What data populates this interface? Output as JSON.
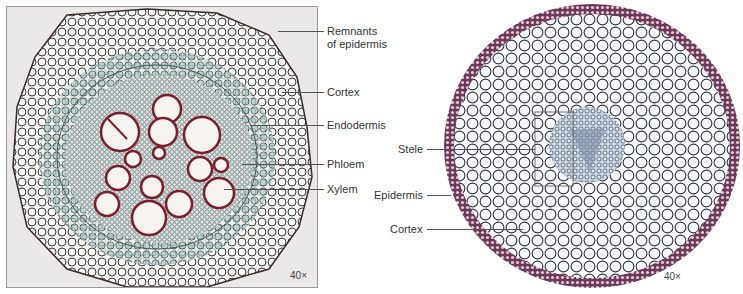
{
  "figures": [
    {
      "id": "left",
      "magnification": "40×",
      "labels": [
        {
          "text": "Remnants",
          "text2": "of epidermis"
        },
        {
          "text": "Cortex"
        },
        {
          "text": "Endodermis"
        },
        {
          "text": "Phloem"
        },
        {
          "text": "Xylem"
        }
      ]
    },
    {
      "id": "right",
      "magnification": "40×",
      "labels": [
        {
          "text": "Stele"
        },
        {
          "text": "Epidermis"
        },
        {
          "text": "Cortex"
        }
      ]
    }
  ],
  "colors": {
    "cell_wall_dark": "#3a2e3a",
    "xylem_wall": "#8a2030",
    "cortex_teal": "#8fb8b8",
    "stele_blue": "#6a7f9a",
    "epidermis_purple": "#6a3a5a"
  }
}
